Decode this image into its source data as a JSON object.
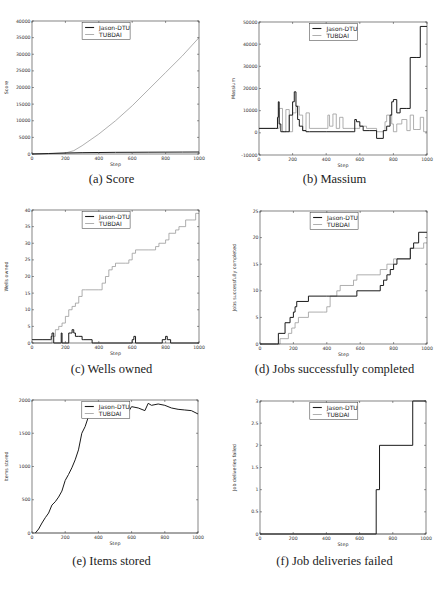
{
  "legend": {
    "entries": [
      {
        "name": "Jason-DTU",
        "color": "#1a1a1a"
      },
      {
        "name": "TUBDAI",
        "color": "#9a9a9a"
      }
    ]
  },
  "captions": {
    "a": "(a) Score",
    "b": "(b) Massium",
    "c": "(c) Wells owned",
    "d": "(d) Jobs successfully completed",
    "e": "(e) Items stored",
    "f": "(f) Job deliveries failed"
  },
  "chart_data": [
    {
      "id": "a",
      "type": "line",
      "title": "(a) Score",
      "xlabel": "Step",
      "ylabel": "Score",
      "xlim": [
        0,
        1000
      ],
      "ylim": [
        0,
        40000
      ],
      "xticks": [
        0,
        200,
        400,
        600,
        800,
        1000
      ],
      "yticks": [
        0,
        5000,
        10000,
        15000,
        20000,
        25000,
        30000,
        35000,
        40000
      ],
      "grid": false,
      "legend_position": "upper left",
      "series": [
        {
          "name": "Jason-DTU",
          "x": [
            0,
            100,
            200,
            300,
            400,
            500,
            600,
            700,
            800,
            900,
            1000
          ],
          "values": [
            0,
            150,
            300,
            400,
            450,
            500,
            520,
            540,
            560,
            580,
            600
          ]
        },
        {
          "name": "TUBDAI",
          "x": [
            0,
            100,
            200,
            250,
            300,
            400,
            500,
            600,
            700,
            800,
            900,
            1000
          ],
          "values": [
            0,
            100,
            300,
            1000,
            2500,
            6000,
            10000,
            14500,
            19500,
            24500,
            29500,
            35000
          ]
        }
      ]
    },
    {
      "id": "b",
      "type": "line",
      "title": "(b) Massium",
      "xlabel": "Step",
      "ylabel": "Massium",
      "xlim": [
        0,
        1000
      ],
      "ylim": [
        -10000,
        50000
      ],
      "xticks": [
        0,
        200,
        400,
        600,
        800,
        1000
      ],
      "yticks": [
        -10000,
        0,
        10000,
        20000,
        30000,
        40000,
        50000
      ],
      "grid": false,
      "legend_position": "upper left",
      "series": [
        {
          "name": "Jason-DTU",
          "x": [
            0,
            100,
            110,
            115,
            120,
            130,
            150,
            180,
            200,
            210,
            220,
            230,
            240,
            260,
            280,
            300,
            400,
            500,
            560,
            570,
            580,
            600,
            620,
            660,
            700,
            740,
            760,
            780,
            790,
            800,
            820,
            840,
            880,
            900,
            940,
            960,
            1000
          ],
          "values": [
            2000,
            2000,
            7000,
            14000,
            4000,
            500,
            500,
            8000,
            14000,
            18500,
            12000,
            6000,
            3000,
            1000,
            500,
            500,
            500,
            500,
            500,
            6000,
            5000,
            3000,
            1000,
            1000,
            -2500,
            1000,
            3000,
            8000,
            14000,
            15000,
            9000,
            11000,
            11000,
            34000,
            34000,
            48000,
            48000
          ]
        },
        {
          "name": "TUBDAI",
          "x": [
            0,
            100,
            120,
            140,
            160,
            180,
            200,
            220,
            240,
            260,
            280,
            300,
            400,
            410,
            420,
            440,
            460,
            480,
            500,
            580,
            600,
            640,
            700,
            740,
            750,
            760,
            790,
            800,
            820,
            850,
            880,
            900,
            920,
            940,
            960,
            980,
            1000
          ],
          "values": [
            2000,
            2000,
            11000,
            500,
            10500,
            500,
            9000,
            12000,
            8000,
            1000,
            9000,
            2000,
            2000,
            8000,
            3000,
            8500,
            2000,
            7000,
            2000,
            2000,
            3000,
            2000,
            500,
            1000,
            5000,
            8000,
            4000,
            500,
            4000,
            6000,
            1000,
            8000,
            1500,
            1500,
            7000,
            500,
            500
          ]
        }
      ]
    },
    {
      "id": "c",
      "type": "line",
      "title": "(c) Wells owned",
      "xlabel": "Step",
      "ylabel": "Wells owned",
      "xlim": [
        0,
        1000
      ],
      "ylim": [
        0,
        40
      ],
      "xticks": [
        0,
        200,
        400,
        600,
        800,
        1000
      ],
      "yticks": [
        0,
        5,
        10,
        15,
        20,
        25,
        30,
        35,
        40
      ],
      "grid": false,
      "legend_position": "upper left",
      "series": [
        {
          "name": "Jason-DTU",
          "x": [
            0,
            60,
            110,
            115,
            120,
            130,
            170,
            175,
            180,
            220,
            230,
            240,
            250,
            260,
            280,
            300,
            310,
            360,
            370,
            580,
            600,
            610,
            620,
            760,
            780,
            800,
            810,
            820,
            830,
            1000
          ],
          "values": [
            1,
            1,
            1,
            2,
            3,
            0,
            0,
            3,
            0,
            3,
            3,
            4,
            3,
            2,
            2,
            1,
            1,
            0,
            0,
            0,
            1,
            2,
            0,
            0,
            1,
            2,
            1,
            1,
            0,
            0
          ]
        },
        {
          "name": "TUBDAI",
          "x": [
            0,
            120,
            140,
            160,
            180,
            200,
            220,
            240,
            260,
            280,
            300,
            320,
            400,
            420,
            440,
            460,
            480,
            500,
            560,
            580,
            600,
            620,
            700,
            740,
            760,
            800,
            820,
            860,
            880,
            920,
            960,
            980,
            1000
          ],
          "values": [
            0,
            2,
            4,
            5,
            6,
            8,
            10,
            11,
            12,
            14,
            16,
            16,
            16,
            18,
            20,
            22,
            23,
            24,
            24,
            25,
            27,
            28,
            28,
            29,
            30,
            31,
            33,
            34,
            35,
            37,
            37,
            39,
            39
          ]
        }
      ]
    },
    {
      "id": "d",
      "type": "line",
      "title": "(d) Jobs successfully completed",
      "xlabel": "Step",
      "ylabel": "Jobs successfully completed",
      "xlim": [
        0,
        1000
      ],
      "ylim": [
        0,
        25
      ],
      "xticks": [
        0,
        200,
        400,
        600,
        800,
        1000
      ],
      "yticks": [
        0,
        5,
        10,
        15,
        20,
        25
      ],
      "grid": false,
      "legend_position": "upper left",
      "series": [
        {
          "name": "Jason-DTU",
          "x": [
            0,
            100,
            110,
            150,
            180,
            200,
            210,
            220,
            290,
            400,
            580,
            720,
            740,
            760,
            780,
            800,
            820,
            900,
            920,
            950,
            1000
          ],
          "values": [
            0,
            0,
            2,
            4,
            5,
            6,
            7,
            8,
            9,
            9,
            10,
            11,
            12,
            13,
            14,
            15,
            16,
            18,
            19,
            21,
            21
          ]
        },
        {
          "name": "TUBDAI",
          "x": [
            0,
            100,
            120,
            170,
            190,
            210,
            230,
            290,
            380,
            400,
            420,
            460,
            480,
            560,
            580,
            700,
            720,
            760,
            790,
            800,
            900,
            960,
            980,
            1000
          ],
          "values": [
            0,
            0,
            1,
            2,
            3,
            4,
            5,
            6,
            6,
            7,
            9,
            10,
            11,
            12,
            13,
            13,
            14,
            15,
            15,
            16,
            18,
            18,
            19,
            19
          ]
        }
      ]
    },
    {
      "id": "e",
      "type": "line",
      "title": "(e) Items stored",
      "xlabel": "Step",
      "ylabel": "Items stored",
      "xlim": [
        0,
        1000
      ],
      "ylim": [
        0,
        2000
      ],
      "xticks": [
        0,
        200,
        400,
        600,
        800,
        1000
      ],
      "yticks": [
        0,
        500,
        1000,
        1500,
        2000
      ],
      "grid": false,
      "legend_position": "upper left",
      "series": [
        {
          "name": "Jason-DTU",
          "x": [
            20,
            40,
            60,
            80,
            100,
            120,
            140,
            160,
            180,
            200,
            220,
            240,
            260,
            280,
            300,
            320,
            340,
            360,
            400,
            440,
            480,
            520,
            560,
            580,
            600,
            640,
            680,
            700,
            720,
            760,
            800,
            840,
            880,
            920,
            960,
            1000
          ],
          "values": [
            0,
            60,
            150,
            230,
            300,
            420,
            470,
            540,
            630,
            790,
            880,
            980,
            1100,
            1250,
            1500,
            1600,
            1750,
            1800,
            1810,
            1830,
            1810,
            1810,
            1780,
            1820,
            1900,
            1880,
            1840,
            1950,
            1920,
            1940,
            1920,
            1880,
            1860,
            1850,
            1840,
            1790
          ]
        },
        {
          "name": "TUBDAI",
          "x": [
            0,
            1000
          ],
          "values": [
            0,
            0
          ]
        }
      ]
    },
    {
      "id": "f",
      "type": "line",
      "title": "(f) Job deliveries failed",
      "xlabel": "Step",
      "ylabel": "Job deliveries failed",
      "xlim": [
        0,
        1000
      ],
      "ylim": [
        0.0,
        3.0
      ],
      "xticks": [
        0,
        200,
        400,
        600,
        800,
        1000
      ],
      "yticks": [
        0.0,
        0.5,
        1.0,
        1.5,
        2.0,
        2.5,
        3.0
      ],
      "grid": false,
      "legend_position": "upper left",
      "series": [
        {
          "name": "Jason-DTU",
          "x": [
            0,
            700,
            700,
            720,
            720,
            920,
            920,
            1000
          ],
          "values": [
            0,
            0,
            1,
            1,
            2,
            2,
            3,
            3
          ]
        },
        {
          "name": "TUBDAI",
          "x": [
            0,
            1000
          ],
          "values": [
            0,
            0
          ]
        }
      ]
    }
  ]
}
